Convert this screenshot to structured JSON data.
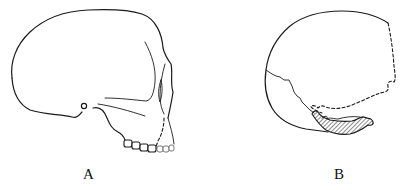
{
  "figure": {
    "panels": [
      {
        "id": "A",
        "label": "A",
        "description": "lateral view of skull with teeth (solid outline, dashed reconstructed portion)"
      },
      {
        "id": "B",
        "label": "B",
        "description": "fragmentary cranium with dashed reconstructed outline and hatched bone region"
      }
    ]
  },
  "colors": {
    "background": "#ffffff",
    "stroke": "#1a1a1a"
  }
}
